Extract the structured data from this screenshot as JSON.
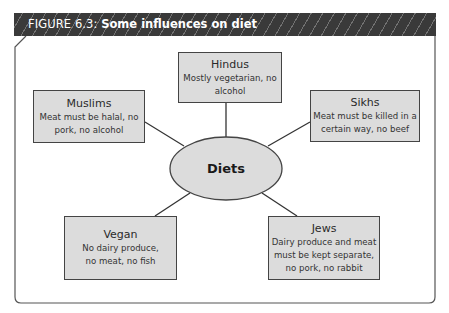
{
  "figure": {
    "label": "FIGURE 6.3:",
    "title": "Some influences on diet",
    "header_color": "#3a3a3a"
  },
  "center": {
    "label": "Diets"
  },
  "nodes": [
    {
      "id": "hindus",
      "title": "Hindus",
      "text": "Mostly vegetarian, no alcohol"
    },
    {
      "id": "muslims",
      "title": "Muslims",
      "text": "Meat must be halal, no pork, no alcohol"
    },
    {
      "id": "sikhs",
      "title": "Sikhs",
      "text": "Meat must be killed in a certain way, no beef"
    },
    {
      "id": "vegan",
      "title": "Vegan",
      "text": "No dairy produce, no meat, no fish"
    },
    {
      "id": "jews",
      "title": "Jews",
      "text": "Dairy produce and meat must be kept separate, no pork, no rabbit"
    }
  ],
  "colors": {
    "box_fill": "#dcdcdc",
    "ellipse_fill": "#dcdcdc",
    "stroke": "#444444"
  }
}
